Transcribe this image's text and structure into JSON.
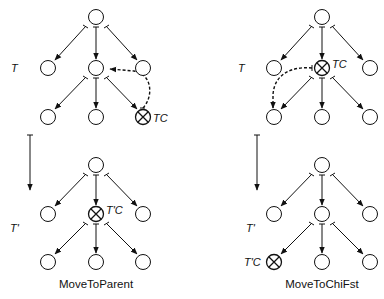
{
  "colors": {
    "ink": "#111111",
    "background": "#ffffff"
  },
  "panels": [
    {
      "caption": "MoveToParent",
      "before_label": "T",
      "after_label": "T'",
      "before_cursor_label": "TC",
      "after_cursor_label": "T'C",
      "before_cursor_node": "level3-right",
      "after_cursor_node": "level2-center",
      "move": "cursor moves from child to parent (dashed arrow to center node)"
    },
    {
      "caption": "MoveToChiFst",
      "before_label": "T",
      "after_label": "T'",
      "before_cursor_label": "TC",
      "after_cursor_label": "T'C",
      "before_cursor_node": "level2-center",
      "after_cursor_node": "level3-left",
      "move": "cursor moves from parent to first child (dashed arrow to left child)"
    }
  ],
  "icons": {
    "cursor": "circled-x-icon",
    "node": "circle-node-icon",
    "transition": "down-arrow-icon"
  }
}
